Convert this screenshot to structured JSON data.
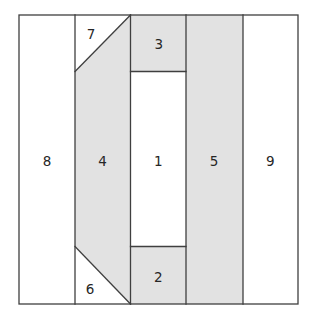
{
  "diagram": {
    "regions": [
      {
        "label": "1",
        "shaded": false
      },
      {
        "label": "2",
        "shaded": true
      },
      {
        "label": "3",
        "shaded": true
      },
      {
        "label": "4",
        "shaded": true
      },
      {
        "label": "5",
        "shaded": true
      },
      {
        "label": "6",
        "shaded": false
      },
      {
        "label": "7",
        "shaded": false
      },
      {
        "label": "8",
        "shaded": false
      },
      {
        "label": "9",
        "shaded": false
      }
    ],
    "colors": {
      "shaded": "#e2e2e2",
      "unshaded": "#ffffff",
      "line": "#3f3f3f",
      "label": "#262626",
      "background": "#ffffff"
    }
  }
}
